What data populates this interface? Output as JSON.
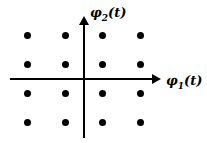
{
  "diagram": {
    "x_axis": {
      "symbol": "φ",
      "subscript": "1",
      "suffix": "(t)"
    },
    "y_axis": {
      "symbol": "φ",
      "subscript": "2",
      "suffix": "(t)"
    },
    "grid": {
      "columns": 4,
      "rows": 4
    },
    "colors": {
      "points": "#000000",
      "axes": "#000000",
      "background": "#ffffff"
    }
  },
  "chart_data": {
    "type": "scatter",
    "title": "",
    "xlabel": "φ1(t)",
    "ylabel": "φ2(t)",
    "x": [
      -3,
      -1,
      1,
      3,
      -3,
      -1,
      1,
      3,
      -3,
      -1,
      1,
      3,
      -3,
      -1,
      1,
      3
    ],
    "y": [
      3,
      3,
      3,
      3,
      1,
      1,
      1,
      1,
      -1,
      -1,
      -1,
      -1,
      -3,
      -3,
      -3,
      -3
    ],
    "grid": false,
    "legend": null
  }
}
